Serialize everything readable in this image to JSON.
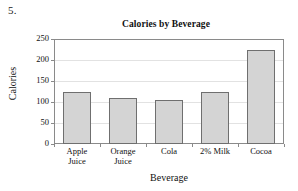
{
  "problem": {
    "number": "5."
  },
  "chart_data": {
    "type": "bar",
    "title": "Calories by Beverage",
    "xlabel": "Beverage",
    "ylabel": "Calories",
    "categories": [
      "Apple Juice",
      "Orange Juice",
      "Cola",
      "2% Milk",
      "Cocoa"
    ],
    "category_lines": [
      [
        "Apple",
        "Juice"
      ],
      [
        "Orange",
        "Juice"
      ],
      [
        "Cola",
        ""
      ],
      [
        "2% Milk",
        ""
      ],
      [
        "Cocoa",
        ""
      ]
    ],
    "values": [
      125,
      110,
      105,
      125,
      225
    ],
    "ylim": [
      0,
      250
    ],
    "ytick_labels": [
      "0",
      "50",
      "100",
      "150",
      "200",
      "250"
    ],
    "ytick_values": [
      0,
      50,
      100,
      150,
      200,
      250
    ],
    "grid": true,
    "legend": "none",
    "bar_fill_color": "#d4d4d4",
    "bar_edge_color": "#6f6f6f",
    "axis_color": "#8a8a8a",
    "grid_color": "#e2e2e2"
  }
}
